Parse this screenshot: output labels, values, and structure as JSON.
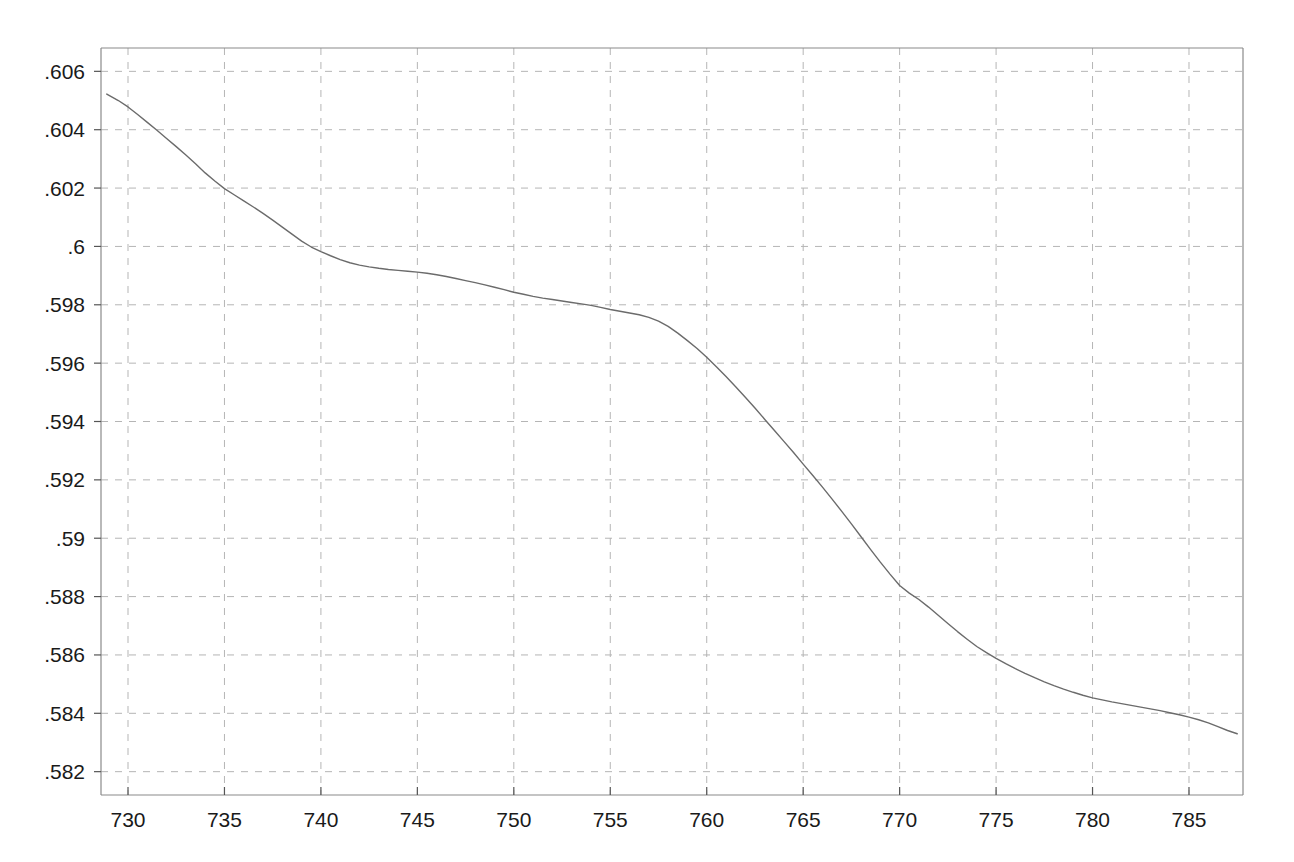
{
  "chart_data": {
    "type": "line",
    "title": "",
    "subtitle": "",
    "xlabel": "",
    "ylabel": "",
    "xlim": [
      728.6,
      787.8
    ],
    "ylim": [
      0.5812,
      0.6068
    ],
    "xticks": [
      730,
      735,
      740,
      745,
      750,
      755,
      760,
      765,
      770,
      775,
      780,
      785
    ],
    "xticklabels": [
      "730",
      "735",
      "740",
      "745",
      "750",
      "755",
      "760",
      "765",
      "770",
      "775",
      "780",
      "785"
    ],
    "yticks": [
      0.582,
      0.584,
      0.586,
      0.588,
      0.59,
      0.592,
      0.594,
      0.596,
      0.598,
      0.6,
      0.602,
      0.604,
      0.606
    ],
    "yticklabels": [
      ".582",
      ".584",
      ".586",
      ".588",
      ".59",
      ".592",
      ".594",
      ".596",
      ".598",
      ".6",
      ".602",
      ".604",
      ".606"
    ],
    "grid": true,
    "grid_style": "dashed",
    "grid_color": "#b5b5b5",
    "legend": null,
    "legend_position": "none",
    "series": [
      {
        "name": "series-1",
        "color": "#6b6b6b",
        "linewidth": 1.4,
        "x": [
          728.9,
          729.5,
          730.0,
          730.5,
          731.0,
          731.5,
          732.0,
          732.5,
          733.0,
          733.5,
          734.0,
          734.5,
          735.0,
          735.5,
          736.0,
          736.5,
          737.0,
          737.5,
          738.0,
          738.5,
          739.0,
          739.5,
          740.0,
          740.5,
          741.0,
          741.5,
          742.0,
          742.5,
          743.0,
          743.5,
          744.0,
          744.5,
          745.0,
          745.5,
          746.0,
          746.5,
          747.0,
          747.5,
          748.0,
          748.5,
          749.0,
          749.5,
          750.0,
          750.5,
          751.0,
          751.5,
          752.0,
          752.5,
          753.0,
          753.5,
          754.0,
          754.5,
          755.0,
          755.5,
          756.0,
          756.5,
          757.0,
          757.5,
          758.0,
          758.5,
          759.0,
          759.5,
          760.0,
          760.5,
          761.0,
          761.5,
          762.0,
          762.5,
          763.0,
          763.5,
          764.0,
          764.5,
          765.0,
          765.5,
          766.0,
          766.5,
          767.0,
          767.5,
          768.0,
          768.5,
          769.0,
          769.5,
          770.0,
          770.5,
          771.0,
          771.5,
          772.0,
          772.5,
          773.0,
          773.5,
          774.0,
          774.5,
          775.0,
          775.5,
          776.0,
          776.5,
          777.0,
          777.5,
          778.0,
          778.5,
          779.0,
          779.5,
          780.0,
          780.5,
          781.0,
          781.5,
          782.0,
          782.5,
          783.0,
          783.5,
          784.0,
          784.5,
          785.0,
          785.5,
          786.0,
          786.5,
          787.0,
          787.5
        ],
        "y": [
          0.60522,
          0.605,
          0.60478,
          0.60452,
          0.60425,
          0.60398,
          0.6037,
          0.60342,
          0.60313,
          0.60283,
          0.60252,
          0.60224,
          0.60198,
          0.60177,
          0.60156,
          0.60135,
          0.60113,
          0.6009,
          0.60066,
          0.60042,
          0.60018,
          0.59998,
          0.59982,
          0.59968,
          0.59955,
          0.59944,
          0.59936,
          0.5993,
          0.59925,
          0.59921,
          0.59918,
          0.59915,
          0.59912,
          0.59908,
          0.59903,
          0.59897,
          0.5989,
          0.59883,
          0.59876,
          0.59868,
          0.5986,
          0.59852,
          0.59843,
          0.59836,
          0.59829,
          0.59823,
          0.59818,
          0.59813,
          0.59808,
          0.59803,
          0.59798,
          0.59791,
          0.59784,
          0.59778,
          0.59772,
          0.59766,
          0.59757,
          0.59744,
          0.59726,
          0.59703,
          0.59677,
          0.5965,
          0.5962,
          0.59588,
          0.59554,
          0.59519,
          0.59483,
          0.59446,
          0.59408,
          0.5937,
          0.59332,
          0.59294,
          0.59254,
          0.59215,
          0.59175,
          0.59134,
          0.59092,
          0.59049,
          0.59005,
          0.58961,
          0.58918,
          0.58877,
          0.58838,
          0.58812,
          0.5879,
          0.58764,
          0.58736,
          0.58708,
          0.5868,
          0.58654,
          0.58629,
          0.58608,
          0.58588,
          0.5857,
          0.58553,
          0.58537,
          0.58522,
          0.58508,
          0.58495,
          0.58483,
          0.58472,
          0.58462,
          0.58453,
          0.58446,
          0.58439,
          0.58433,
          0.58427,
          0.58421,
          0.58415,
          0.58409,
          0.58402,
          0.58395,
          0.58387,
          0.58378,
          0.58367,
          0.58354,
          0.58341,
          0.5833
        ]
      }
    ]
  },
  "plot_geometry": {
    "left": 101,
    "right": 1243,
    "top": 48,
    "bottom": 795
  }
}
